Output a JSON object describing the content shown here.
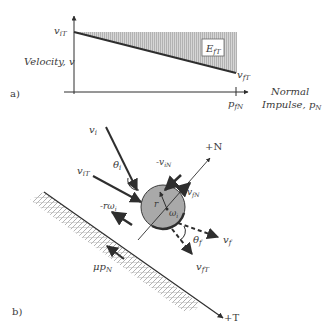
{
  "panel_a": {
    "label": "a)",
    "y_axis_label": "Velocity, v",
    "x_axis_label_line1": "Normal",
    "x_axis_label_line2": "Impulse, p",
    "x_axis_label_sub": "N",
    "v_iT": {
      "base": "v",
      "sub": "iT"
    },
    "v_fT": {
      "base": "v",
      "sub": "fT"
    },
    "p_fN": {
      "base": "p",
      "sub": "fN"
    },
    "energy_box": {
      "base": "E",
      "sub": "fT"
    },
    "colors": {
      "shade": "#c8c8c8",
      "line": "#2e2e2e"
    }
  },
  "panel_b": {
    "label": "b)",
    "v_i": {
      "base": "v",
      "sub": "i"
    },
    "v_iT": {
      "base": "v",
      "sub": "iT"
    },
    "minus_v_iN": {
      "base": "-v",
      "sub": "iN"
    },
    "v_fN": {
      "base": "v",
      "sub": "fN"
    },
    "plus_N": "+N",
    "plus_T": "+T",
    "theta_i": {
      "base": "θ",
      "sub": "i"
    },
    "theta_f": {
      "base": "θ",
      "sub": "f"
    },
    "v_f": {
      "base": "v",
      "sub": "f"
    },
    "v_fT": {
      "base": "v",
      "sub": "fT"
    },
    "r": "r",
    "omega_i": {
      "base": "ω",
      "sub": "i"
    },
    "minus_r_omega_i": {
      "base": "-rω",
      "sub": "i"
    },
    "mu_p_N": {
      "base": "μp",
      "sub": "N"
    },
    "colors": {
      "ball": "#a9a9a9",
      "line": "#2e2e2e",
      "hatch": "#8a8a8a"
    }
  }
}
